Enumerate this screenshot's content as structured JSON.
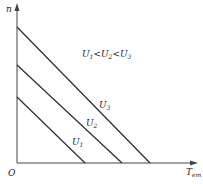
{
  "diagram": {
    "axes": {
      "y_label": "n",
      "x_label": "T",
      "x_label_sub": "em",
      "origin_label": "O"
    },
    "annotation": {
      "text_parts": [
        "U",
        "1",
        "<U",
        "2",
        "<U",
        "3"
      ],
      "meaning": "U1<U2<U3"
    },
    "curves": [
      {
        "name": "U",
        "sub": "1",
        "start": [
          17,
          97
        ],
        "end": [
          85,
          163
        ]
      },
      {
        "name": "U",
        "sub": "2",
        "start": [
          17,
          65
        ],
        "end": [
          122,
          163
        ]
      },
      {
        "name": "U",
        "sub": "3",
        "start": [
          17,
          27
        ],
        "end": [
          150,
          163
        ]
      }
    ],
    "colors": {
      "line": "#2a2a2a",
      "axis": "#333333",
      "text": "#222222"
    }
  }
}
